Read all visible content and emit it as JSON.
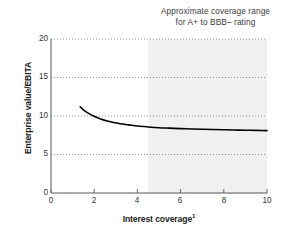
{
  "chart_data": {
    "type": "line",
    "title": "",
    "annotation": {
      "line1": "Approximate coverage range",
      "line2": "for A+ to BBB– rating"
    },
    "xlabel": "Interest coverage",
    "xlabel_footnote": "1",
    "ylabel": "Enterprise value/EBITA",
    "xlim": [
      0,
      10
    ],
    "ylim": [
      0,
      20
    ],
    "xticks": [
      "0",
      "2",
      "4",
      "6",
      "8",
      "10"
    ],
    "xtick_values": [
      0,
      2,
      4,
      6,
      8,
      10
    ],
    "yticks": [
      "0",
      "5",
      "10",
      "15",
      "20"
    ],
    "ytick_values": [
      0,
      5,
      10,
      15,
      20
    ],
    "grid": "horizontal-dotted",
    "legend": "none",
    "shaded_band": {
      "label": "Approximate coverage range for A+ to BBB– rating",
      "x_start": 4.5,
      "x_end": 10,
      "color": "#f0f0f0"
    },
    "series": [
      {
        "name": "Enterprise value/EBITA vs interest coverage",
        "color": "#000000",
        "x": [
          1.35,
          1.5,
          1.7,
          1.9,
          2.1,
          2.3,
          2.6,
          2.9,
          3.2,
          3.6,
          4.0,
          4.5,
          5.0,
          5.5,
          6.0,
          6.5,
          7.0,
          7.5,
          8.0,
          8.5,
          9.0,
          9.5,
          10.0
        ],
        "values": [
          11.2,
          10.8,
          10.4,
          10.1,
          9.85,
          9.6,
          9.35,
          9.15,
          9.0,
          8.85,
          8.7,
          8.58,
          8.48,
          8.42,
          8.36,
          8.32,
          8.28,
          8.24,
          8.21,
          8.18,
          8.15,
          8.13,
          8.1
        ]
      }
    ]
  }
}
